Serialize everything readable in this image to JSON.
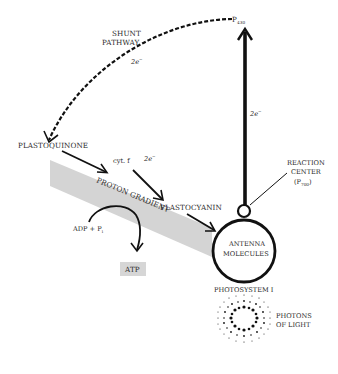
{
  "diagram": {
    "nodes": {
      "p430": {
        "main": "P",
        "sub": "430"
      },
      "shunt": {
        "line1": "SHUNT",
        "line2": "PATHWAY"
      },
      "shunt_electrons": {
        "main": "2e",
        "sup": "−"
      },
      "vertical_electrons": {
        "main": "2e",
        "sup": "−"
      },
      "plastoquinone": "PLASTOQUINONE",
      "cyt_f": "cyt. f",
      "cyt_electrons": {
        "main": "2e",
        "sup": "−"
      },
      "plastocyanin": "PLASTOCYANIN",
      "proton_gradient": "PROTON GRADIENT",
      "adp": {
        "main": "ADP + P",
        "sub": "i"
      },
      "atp": "ATP",
      "reaction_center": {
        "line1": "REACTION",
        "line2": "CENTER",
        "line3_main": "(P",
        "line3_sub": "700",
        "line3_end": ")"
      },
      "antenna": {
        "line1": "ANTENNA",
        "line2": "MOLECULES"
      },
      "photosystem": "PHOTOSYSTEM I",
      "photons": {
        "line1": "PHOTONS",
        "line2": "OF LIGHT"
      }
    },
    "colors": {
      "ink": "#111111",
      "gradient_band": "#d4d4d4",
      "atp_box": "#d6d6d6",
      "text": "#2a2a2a"
    }
  }
}
